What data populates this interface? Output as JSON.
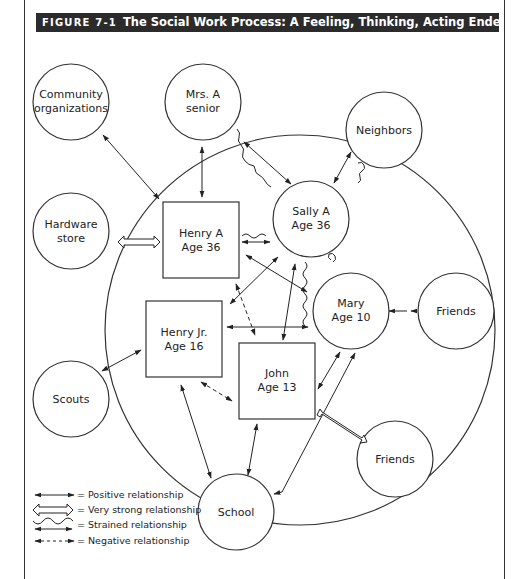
{
  "figure": {
    "number": "FIGURE 7-1",
    "title": "The Social Work Process: A Feeling, Thinking, Acting Endeavour"
  },
  "nodes": {
    "community": {
      "line1": "Community",
      "line2": "organizations"
    },
    "mrs_a": {
      "line1": "Mrs. A",
      "line2": "senior"
    },
    "neighbors": {
      "line1": "Neighbors"
    },
    "hardware": {
      "line1": "Hardware",
      "line2": "store"
    },
    "henry_a": {
      "line1": "Henry A",
      "line2": "Age 36"
    },
    "sally_a": {
      "line1": "Sally A",
      "line2": "Age 36"
    },
    "mary": {
      "line1": "Mary",
      "line2": "Age 10"
    },
    "friends_right": {
      "line1": "Friends"
    },
    "henry_jr": {
      "line1": "Henry Jr.",
      "line2": "Age 16"
    },
    "john": {
      "line1": "John",
      "line2": "Age 13"
    },
    "scouts": {
      "line1": "Scouts"
    },
    "friends_lower": {
      "line1": "Friends"
    },
    "school": {
      "line1": "School"
    }
  },
  "legend": {
    "positive": "= Positive relationship",
    "very_strong": "= Very strong relationship",
    "strained": "= Strained relationship",
    "negative": "= Negative relationship"
  },
  "relationships": [
    {
      "from": "Community organizations",
      "to": "Henry A",
      "type": "positive"
    },
    {
      "from": "Mrs. A senior",
      "to": "Henry A",
      "type": "positive"
    },
    {
      "from": "Mrs. A senior",
      "to": "Sally A",
      "type": "strained"
    },
    {
      "from": "Neighbors",
      "to": "Sally A",
      "type": "strained"
    },
    {
      "from": "Hardware store",
      "to": "Henry A",
      "type": "very_strong"
    },
    {
      "from": "Henry A",
      "to": "Sally A",
      "type": "strained"
    },
    {
      "from": "Henry A",
      "to": "Mary",
      "type": "positive"
    },
    {
      "from": "Sally A",
      "to": "Henry Jr.",
      "type": "positive"
    },
    {
      "from": "Henry A",
      "to": "John",
      "type": "negative"
    },
    {
      "from": "Sally A",
      "to": "John",
      "type": "positive"
    },
    {
      "from": "Sally A",
      "to": "John",
      "type": "strained"
    },
    {
      "from": "Sally A",
      "to": "Mary",
      "type": "strained"
    },
    {
      "from": "Henry Jr.",
      "to": "Mary",
      "type": "positive"
    },
    {
      "from": "Mary",
      "to": "Friends",
      "type": "positive"
    },
    {
      "from": "Henry Jr.",
      "to": "Scouts",
      "type": "positive"
    },
    {
      "from": "Henry Jr.",
      "to": "John",
      "type": "negative"
    },
    {
      "from": "Henry Jr.",
      "to": "School",
      "type": "positive"
    },
    {
      "from": "John",
      "to": "School",
      "type": "positive"
    },
    {
      "from": "John",
      "to": "Mary",
      "type": "positive"
    },
    {
      "from": "John",
      "to": "Friends",
      "type": "very_strong"
    },
    {
      "from": "Mary",
      "to": "School",
      "type": "positive"
    }
  ]
}
